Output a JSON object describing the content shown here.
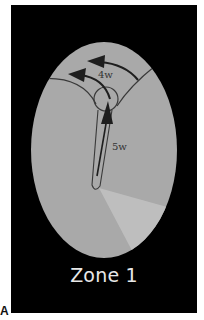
{
  "figure": {
    "panel_letter": "A",
    "zone_label": "Zone 1",
    "labels": {
      "upper_arrow": "4w",
      "vertical_arrow": "5w"
    },
    "colors": {
      "background": "#000000",
      "ellipse_fill": "#a9a9a9",
      "wedge_fill": "#c2c2c2",
      "line": "#3a3a3a",
      "arrow": "#1e1e1e",
      "zone_text": "#e8e8e8"
    }
  }
}
